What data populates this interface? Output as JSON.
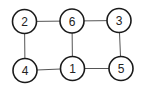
{
  "diagram": {
    "type": "graph",
    "colors": {
      "background": "#ffffff",
      "node_stroke": "#1a1a1a",
      "edge_stroke": "#555555",
      "label": "#222222"
    },
    "nodes": [
      {
        "id": "2",
        "label": "2",
        "x": 24.5,
        "y": 21.5
      },
      {
        "id": "6",
        "label": "6",
        "x": 72,
        "y": 21
      },
      {
        "id": "3",
        "label": "3",
        "x": 119,
        "y": 20.5
      },
      {
        "id": "4",
        "label": "4",
        "x": 25,
        "y": 70.5
      },
      {
        "id": "1",
        "label": "1",
        "x": 72.5,
        "y": 68.5
      },
      {
        "id": "5",
        "label": "5",
        "x": 121,
        "y": 68.5
      }
    ],
    "edges": [
      {
        "from": "2",
        "to": "6"
      },
      {
        "from": "6",
        "to": "3"
      },
      {
        "from": "2",
        "to": "4"
      },
      {
        "from": "6",
        "to": "1"
      },
      {
        "from": "3",
        "to": "5"
      },
      {
        "from": "4",
        "to": "1"
      },
      {
        "from": "1",
        "to": "5"
      }
    ],
    "node_radius": 12
  }
}
